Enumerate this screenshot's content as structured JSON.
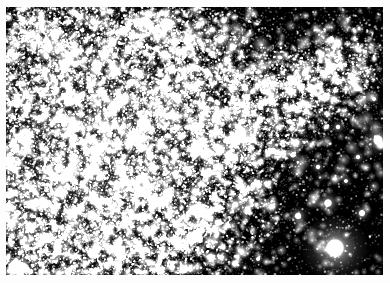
{
  "figure": {
    "kind": "astronomical-image",
    "alt_text": "Black-and-white astronomical photograph of a dense field of stars with a bright diagonal band of resolved stars and several very bright foreground stars",
    "border_color": "#fdfdfd",
    "sky_color": "#000000",
    "star_color": "#ffffff",
    "border_px": 6,
    "plate": {
      "x": 6,
      "y": 7,
      "width": 377,
      "height": 268
    }
  },
  "chart_data": {
    "type": "scatter",
    "title": "",
    "xlabel": "",
    "ylabel": "",
    "xlim": [
      0,
      377
    ],
    "ylim": [
      0,
      268
    ],
    "grid": false,
    "legend": "none",
    "background": "#000000",
    "point_color": "#ffffff",
    "density_field": {
      "haze_centers": [
        {
          "x": 55,
          "y": 120,
          "radius": 150,
          "strength": 1.0
        },
        {
          "x": 120,
          "y": 95,
          "radius": 130,
          "strength": 0.85
        },
        {
          "x": 20,
          "y": 200,
          "radius": 120,
          "strength": 0.7
        },
        {
          "x": 150,
          "y": 160,
          "radius": 110,
          "strength": 0.6
        },
        {
          "x": 95,
          "y": 240,
          "radius": 100,
          "strength": 0.55
        }
      ],
      "band": {
        "p0": {
          "x": 95,
          "y": 195
        },
        "p1": {
          "x": 340,
          "y": 60
        },
        "half_width": 34,
        "strength": 0.85
      }
    },
    "layers": [
      {
        "name": "faint-haze",
        "count": 26000,
        "size_min": 0.35,
        "size_max": 1.1,
        "alpha_min": 0.1,
        "alpha_max": 0.55
      },
      {
        "name": "mid-stars",
        "count": 5200,
        "size_min": 0.9,
        "size_max": 2.2,
        "alpha_min": 0.35,
        "alpha_max": 0.95
      },
      {
        "name": "resolved-stars",
        "count": 1100,
        "size_min": 2.0,
        "size_max": 4.2,
        "alpha_min": 0.55,
        "alpha_max": 1.0
      }
    ],
    "bright_stars": [
      {
        "x": 329,
        "y": 241,
        "radius": 34,
        "core": 9.5,
        "brightness": 1.0
      },
      {
        "x": 196,
        "y": 205,
        "radius": 19,
        "core": 5.5,
        "brightness": 0.95
      },
      {
        "x": 372,
        "y": 133,
        "radius": 17,
        "core": 5.0,
        "brightness": 0.92
      },
      {
        "x": 322,
        "y": 196,
        "radius": 13,
        "core": 4.2,
        "brightness": 0.88
      },
      {
        "x": 292,
        "y": 209,
        "radius": 11,
        "core": 3.6,
        "brightness": 0.82
      },
      {
        "x": 356,
        "y": 206,
        "radius": 10,
        "core": 3.4,
        "brightness": 0.8
      },
      {
        "x": 267,
        "y": 144,
        "radius": 11,
        "core": 3.6,
        "brightness": 0.84
      },
      {
        "x": 287,
        "y": 148,
        "radius": 9,
        "core": 3.0,
        "brightness": 0.76
      },
      {
        "x": 247,
        "y": 178,
        "radius": 9,
        "core": 3.0,
        "brightness": 0.74
      },
      {
        "x": 210,
        "y": 160,
        "radius": 9,
        "core": 3.0,
        "brightness": 0.74
      },
      {
        "x": 163,
        "y": 184,
        "radius": 9,
        "core": 3.0,
        "brightness": 0.76
      },
      {
        "x": 128,
        "y": 192,
        "radius": 8,
        "core": 2.7,
        "brightness": 0.72
      },
      {
        "x": 92,
        "y": 212,
        "radius": 9,
        "core": 3.0,
        "brightness": 0.74
      },
      {
        "x": 58,
        "y": 230,
        "radius": 9,
        "core": 3.0,
        "brightness": 0.75
      },
      {
        "x": 30,
        "y": 196,
        "radius": 8,
        "core": 2.7,
        "brightness": 0.7
      },
      {
        "x": 14,
        "y": 246,
        "radius": 8,
        "core": 2.6,
        "brightness": 0.68
      },
      {
        "x": 112,
        "y": 244,
        "radius": 8,
        "core": 2.7,
        "brightness": 0.7
      },
      {
        "x": 150,
        "y": 232,
        "radius": 7,
        "core": 2.4,
        "brightness": 0.66
      },
      {
        "x": 214,
        "y": 250,
        "radius": 8,
        "core": 2.6,
        "brightness": 0.68
      },
      {
        "x": 252,
        "y": 252,
        "radius": 7,
        "core": 2.4,
        "brightness": 0.66
      },
      {
        "x": 184,
        "y": 262,
        "radius": 7,
        "core": 2.3,
        "brightness": 0.64
      },
      {
        "x": 300,
        "y": 104,
        "radius": 9,
        "core": 3.0,
        "brightness": 0.78
      },
      {
        "x": 332,
        "y": 120,
        "radius": 8,
        "core": 2.7,
        "brightness": 0.72
      },
      {
        "x": 352,
        "y": 150,
        "radius": 8,
        "core": 2.6,
        "brightness": 0.7
      },
      {
        "x": 312,
        "y": 160,
        "radius": 8,
        "core": 2.6,
        "brightness": 0.7
      },
      {
        "x": 232,
        "y": 120,
        "radius": 7,
        "core": 2.4,
        "brightness": 0.68
      },
      {
        "x": 256,
        "y": 96,
        "radius": 7,
        "core": 2.3,
        "brightness": 0.66
      },
      {
        "x": 346,
        "y": 70,
        "radius": 7,
        "core": 2.3,
        "brightness": 0.64
      },
      {
        "x": 368,
        "y": 92,
        "radius": 7,
        "core": 2.3,
        "brightness": 0.64
      },
      {
        "x": 288,
        "y": 52,
        "radius": 6,
        "core": 2.1,
        "brightness": 0.6
      },
      {
        "x": 80,
        "y": 34,
        "radius": 7,
        "core": 2.3,
        "brightness": 0.64
      },
      {
        "x": 142,
        "y": 40,
        "radius": 6,
        "core": 2.1,
        "brightness": 0.6
      },
      {
        "x": 196,
        "y": 62,
        "radius": 6,
        "core": 2.1,
        "brightness": 0.6
      },
      {
        "x": 42,
        "y": 78,
        "radius": 6,
        "core": 2.1,
        "brightness": 0.6
      },
      {
        "x": 118,
        "y": 118,
        "radius": 7,
        "core": 2.3,
        "brightness": 0.64
      },
      {
        "x": 172,
        "y": 110,
        "radius": 6,
        "core": 2.1,
        "brightness": 0.6
      },
      {
        "x": 66,
        "y": 158,
        "radius": 7,
        "core": 2.3,
        "brightness": 0.64
      },
      {
        "x": 222,
        "y": 218,
        "radius": 7,
        "core": 2.4,
        "brightness": 0.66
      },
      {
        "x": 262,
        "y": 228,
        "radius": 6,
        "core": 2.1,
        "brightness": 0.62
      },
      {
        "x": 340,
        "y": 174,
        "radius": 7,
        "core": 2.3,
        "brightness": 0.66
      }
    ],
    "seed": 20240617
  }
}
